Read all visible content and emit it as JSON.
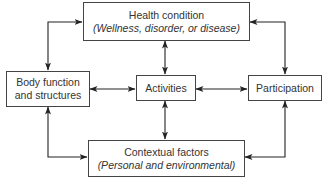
{
  "diagram": {
    "nodes": {
      "health": {
        "title": "Health condition",
        "subtitle": "(Wellness, disorder, or disease)"
      },
      "body": {
        "line1": "Body function",
        "line2": "and structures"
      },
      "activities": {
        "title": "Activities"
      },
      "participation": {
        "title": "Participation"
      },
      "contextual": {
        "title": "Contextual factors",
        "subtitle": "(Personal and environmental)"
      }
    },
    "edges": [
      {
        "from": "health",
        "to": "body",
        "type": "bidirectional"
      },
      {
        "from": "health",
        "to": "activities",
        "type": "bidirectional"
      },
      {
        "from": "health",
        "to": "participation",
        "type": "bidirectional"
      },
      {
        "from": "body",
        "to": "activities",
        "type": "bidirectional"
      },
      {
        "from": "activities",
        "to": "participation",
        "type": "bidirectional"
      },
      {
        "from": "body",
        "to": "contextual",
        "type": "bidirectional"
      },
      {
        "from": "activities",
        "to": "contextual",
        "type": "bidirectional"
      },
      {
        "from": "participation",
        "to": "contextual",
        "type": "bidirectional"
      }
    ],
    "colors": {
      "line": "#222222",
      "border": "#444444",
      "background": "#ffffff"
    }
  }
}
